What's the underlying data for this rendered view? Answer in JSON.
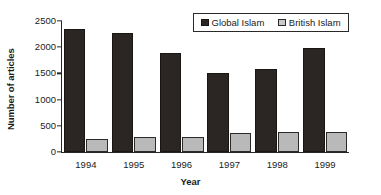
{
  "chart_data": {
    "type": "bar",
    "title": "",
    "xlabel": "Year",
    "ylabel": "Number of articles",
    "categories": [
      "1994",
      "1995",
      "1996",
      "1997",
      "1998",
      "1999"
    ],
    "series": [
      {
        "name": "Global Islam",
        "color": "#2b2523",
        "values": [
          2350,
          2270,
          1885,
          1510,
          1590,
          1985
        ]
      },
      {
        "name": "British Islam",
        "color": "#b9b9b9",
        "values": [
          240,
          285,
          290,
          370,
          380,
          380
        ]
      }
    ],
    "ylim": [
      0,
      2500
    ],
    "yticks": [
      0,
      500,
      1000,
      1500,
      2000,
      2500
    ],
    "yticklabels": [
      "0",
      "500",
      "1000",
      "1500",
      "2000",
      "2500"
    ],
    "grid": false,
    "legend_position": "top-right",
    "legend_entries": [
      "Global Islam",
      "British Islam"
    ]
  },
  "axes": {
    "y_title": "Number of articles",
    "x_title": "Year"
  }
}
